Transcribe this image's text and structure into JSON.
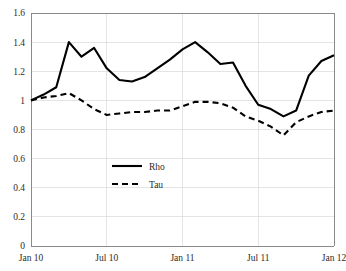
{
  "chart_data": {
    "type": "line",
    "title": "",
    "xlabel": "",
    "ylabel": "",
    "ylim": [
      0,
      1.6
    ],
    "yticks": [
      0,
      0.2,
      0.4,
      0.6,
      0.8,
      1,
      1.2,
      1.4,
      1.6
    ],
    "ytick_labels": [
      "0",
      "0.2",
      "0.4",
      "0.6",
      "0.8",
      "1",
      "1.2",
      "1.4",
      "1.6"
    ],
    "grid": true,
    "grid_axis": "both",
    "legend_position": "center-left",
    "x": [
      "Jan 10",
      "Feb 10",
      "Mar 10",
      "Apr 10",
      "May 10",
      "Jun 10",
      "Jul 10",
      "Aug 10",
      "Sep 10",
      "Oct 10",
      "Nov 10",
      "Dec 10",
      "Jan 11",
      "Feb 11",
      "Mar 11",
      "Apr 11",
      "May 11",
      "Jun 11",
      "Jul 11",
      "Aug 11",
      "Sep 11",
      "Oct 11",
      "Nov 11",
      "Dec 11",
      "Jan 12"
    ],
    "xtick_labels": [
      "Jan 10",
      "Jul 10",
      "Jan 11",
      "Jul 11",
      "Jan 12"
    ],
    "xtick_positions": [
      0,
      6,
      12,
      18,
      24
    ],
    "series": [
      {
        "name": "Rho",
        "style": "solid",
        "color": "#000000",
        "values": [
          1.0,
          1.04,
          1.09,
          1.4,
          1.3,
          1.36,
          1.22,
          1.14,
          1.13,
          1.16,
          1.22,
          1.28,
          1.35,
          1.4,
          1.33,
          1.25,
          1.26,
          1.1,
          0.97,
          0.94,
          0.89,
          0.93,
          1.17,
          1.27,
          1.31
        ]
      },
      {
        "name": "Tau",
        "style": "dashed",
        "color": "#000000",
        "values": [
          1.0,
          1.02,
          1.03,
          1.05,
          1.0,
          0.94,
          0.9,
          0.91,
          0.92,
          0.92,
          0.93,
          0.93,
          0.96,
          0.99,
          0.99,
          0.98,
          0.95,
          0.89,
          0.86,
          0.82,
          0.76,
          0.85,
          0.89,
          0.92,
          0.93
        ]
      }
    ]
  },
  "legend": {
    "items": [
      {
        "label": "Rho"
      },
      {
        "label": "Tau"
      }
    ]
  }
}
